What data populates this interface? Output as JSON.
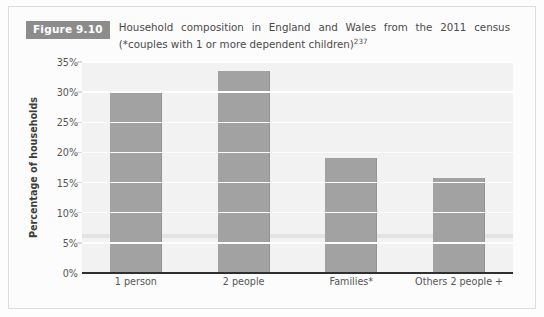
{
  "figure": {
    "badge_label": "Figure 9.10",
    "caption_line1": "Household composition in England and Wales from the 2011 census",
    "caption_line2": "(*couples with 1 or more dependent children)",
    "caption_superscript": "237"
  },
  "colors": {
    "bar": "#a2a2a2",
    "badge_background": "#8c8c8c",
    "badge_text": "#ffffff",
    "plot_background": "#f2f2f2",
    "gridline": "#fdfdfd",
    "axis_line": "#2f2f2f",
    "caption_text": "#4a4a4a",
    "tick_text": "#555555"
  },
  "chart_data": {
    "type": "bar",
    "title": "Household composition in England and Wales from the 2011 census (*couples with 1 or more dependent children)",
    "categories": [
      "1 person",
      "2 people",
      "Families*",
      "Others 2 people +"
    ],
    "values": [
      30,
      33.5,
      19,
      15.8
    ],
    "xlabel": "",
    "ylabel": "Percentage of households",
    "ylim": [
      0,
      35
    ],
    "ytick_values": [
      0,
      5,
      10,
      15,
      20,
      25,
      30,
      35
    ],
    "ytick_labels": [
      "0%",
      "5%",
      "10%",
      "15%",
      "20%",
      "25%",
      "30%",
      "35%"
    ],
    "grid": true,
    "legend": null,
    "series": [
      {
        "name": "Percentage of households",
        "values": [
          30,
          33.5,
          19,
          15.8
        ]
      }
    ]
  }
}
